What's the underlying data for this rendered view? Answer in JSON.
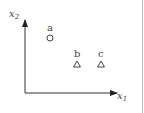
{
  "diagram": {
    "axes": {
      "x_label": {
        "var": "x",
        "sub": "1"
      },
      "y_label": {
        "var": "x",
        "sub": "2"
      }
    },
    "points": [
      {
        "label": "a",
        "marker": "circle"
      },
      {
        "label": "b",
        "marker": "triangle"
      },
      {
        "label": "c",
        "marker": "triangle"
      }
    ]
  }
}
